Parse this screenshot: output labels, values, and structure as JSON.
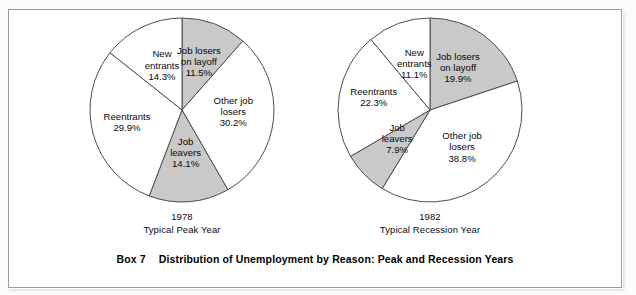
{
  "figure": {
    "caption_label": "Box 7",
    "caption_title": "Distribution of Unemployment by Reason: Peak and Recession Years",
    "shaded_color": "#c9c9c9",
    "unshaded_color": "#ffffff",
    "outline_color": "#4d4d4d"
  },
  "chart_data": [
    {
      "type": "pie",
      "title": "1978",
      "subtitle": "Typical Peak Year",
      "xlabel": "",
      "ylabel": "",
      "legend": "none",
      "categories": [
        "Job losers on layoff",
        "Other job losers",
        "Job leavers",
        "Reentrants",
        "New entrants"
      ],
      "values": [
        11.5,
        30.2,
        14.1,
        29.9,
        14.3
      ],
      "slices": [
        {
          "label_line1": "Job losers",
          "label_line2": "on layoff",
          "value_label": "11.5%",
          "value": 11.5,
          "shaded": true
        },
        {
          "label_line1": "Other job",
          "label_line2": "losers",
          "value_label": "30.2%",
          "value": 30.2,
          "shaded": false
        },
        {
          "label_line1": "Job",
          "label_line2": "leavers",
          "value_label": "14.1%",
          "value": 14.1,
          "shaded": true
        },
        {
          "label_line1": "Reentrants",
          "label_line2": "",
          "value_label": "29.9%",
          "value": 29.9,
          "shaded": false
        },
        {
          "label_line1": "New",
          "label_line2": "entrants",
          "value_label": "14.3%",
          "value": 14.3,
          "shaded": false
        }
      ]
    },
    {
      "type": "pie",
      "title": "1982",
      "subtitle": "Typical Recession Year",
      "xlabel": "",
      "ylabel": "",
      "legend": "none",
      "categories": [
        "Job losers on layoff",
        "Other job losers",
        "Job leavers",
        "Reentrants",
        "New entrants"
      ],
      "values": [
        19.9,
        38.8,
        7.9,
        22.3,
        11.1
      ],
      "slices": [
        {
          "label_line1": "Job losers",
          "label_line2": "on layoff",
          "value_label": "19.9%",
          "value": 19.9,
          "shaded": true
        },
        {
          "label_line1": "Other job",
          "label_line2": "losers",
          "value_label": "38.8%",
          "value": 38.8,
          "shaded": false
        },
        {
          "label_line1": "Job",
          "label_line2": "leavers",
          "value_label": "7.9%",
          "value": 7.9,
          "shaded": true
        },
        {
          "label_line1": "Reentrants",
          "label_line2": "",
          "value_label": "22.3%",
          "value": 22.3,
          "shaded": false
        },
        {
          "label_line1": "New",
          "label_line2": "entrants",
          "value_label": "11.1%",
          "value": 11.1,
          "shaded": false
        }
      ]
    }
  ]
}
